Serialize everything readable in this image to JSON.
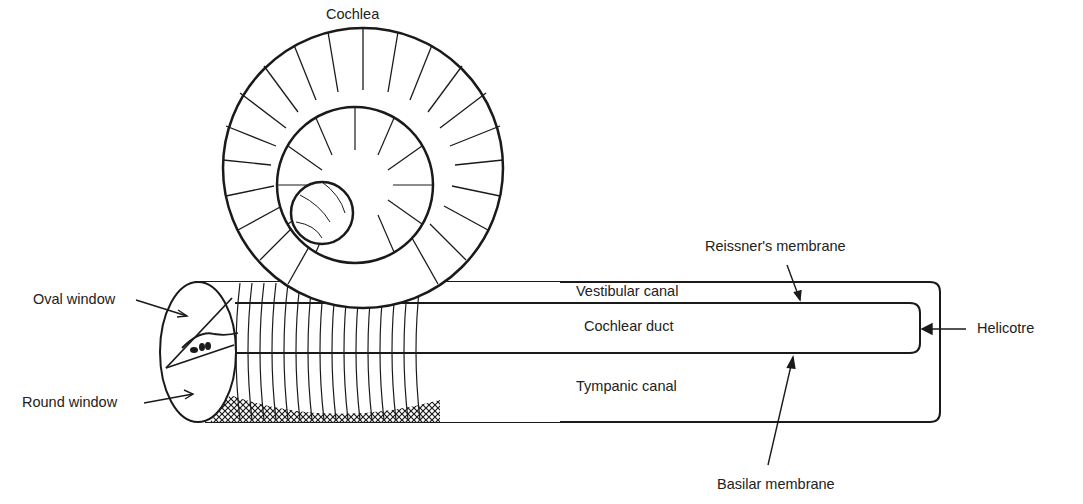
{
  "figure": {
    "title": "Cochlea",
    "labels": {
      "oval_window": "Oval window",
      "round_window": "Round window",
      "vestibular_canal": "Vestibular canal",
      "cochlear_duct": "Cochlear duct",
      "tympanic_canal": "Tympanic canal",
      "reissners_membrane": "Reissner's membrane",
      "basilar_membrane": "Basilar membrane",
      "helicotre": "Helicotre"
    },
    "caption_fragment": "18.13"
  },
  "colors": {
    "ink": "#1a1a1a",
    "background": "#ffffff"
  }
}
